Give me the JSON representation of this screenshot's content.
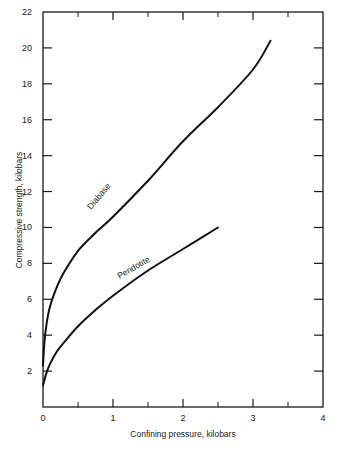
{
  "chart_data": {
    "type": "line",
    "title": "",
    "xlabel": "Confining pressure, kilobars",
    "ylabel": "Compressive strength, kilobars",
    "xlim": [
      0,
      4
    ],
    "ylim": [
      0,
      22
    ],
    "x_ticks": [
      0,
      1,
      2,
      3,
      4
    ],
    "x_minor_ticks": [
      0.5,
      1.5,
      2.5,
      3.5
    ],
    "y_ticks": [
      2,
      4,
      6,
      8,
      10,
      12,
      14,
      16,
      18,
      20,
      22
    ],
    "grid": false,
    "legend": "inline curve labels",
    "series": [
      {
        "name": "Diabase",
        "x": [
          0,
          0.02,
          0.05,
          0.1,
          0.2,
          0.3,
          0.5,
          0.75,
          1.0,
          1.5,
          2.0,
          2.5,
          3.0,
          3.25
        ],
        "y": [
          2.3,
          3.6,
          4.6,
          5.6,
          6.7,
          7.5,
          8.7,
          9.7,
          10.6,
          12.6,
          14.8,
          16.7,
          18.8,
          20.4
        ]
      },
      {
        "name": "Peridotite",
        "x": [
          0,
          0.05,
          0.1,
          0.2,
          0.3,
          0.5,
          0.75,
          1.0,
          1.5,
          2.0,
          2.5
        ],
        "y": [
          1.2,
          1.9,
          2.4,
          3.1,
          3.6,
          4.5,
          5.4,
          6.2,
          7.6,
          8.8,
          10.0
        ]
      }
    ]
  },
  "labels": {
    "x_axis_title": "Confining pressure, kilobars",
    "y_axis_title": "Compressive strength, kilobars",
    "diabase": "Diabase",
    "peridotite": "Peridotite"
  }
}
